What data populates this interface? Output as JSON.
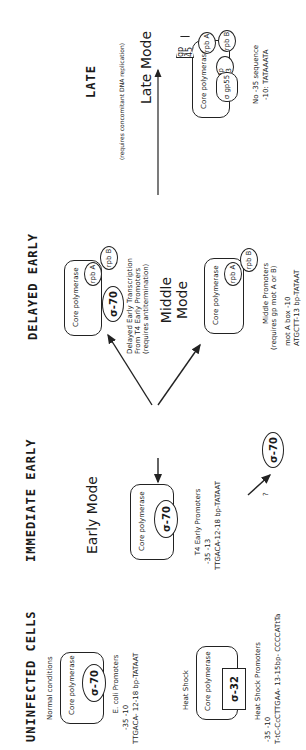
{
  "sections": {
    "uninfected": {
      "title": "UNINFECTED CELLS",
      "normal_label": "Normal conditions",
      "core_label": "Core polymerase",
      "sigma_label": "σ-70",
      "promoter_title": "E. coli Promoters",
      "promoter_positions": "-35          -10",
      "promoter_seq": "TTGACA- 12-18 bp-TATAAT",
      "heat_label": "Heat Shock",
      "heat_core_label": "Core polymerase",
      "heat_sigma_label": "σ-32",
      "heat_promoter_title": "Heat Shock Promoters",
      "heat_promoter_positions": "-35                    -10",
      "heat_promoter_seq": "T-tC-CcCTTGAA- 13-15bp- CCCCATtTa"
    },
    "immediate_early": {
      "title": "IMMEDIATE EARLY",
      "mode": "Early Mode",
      "core_label": "Core polymerase",
      "sigma_label": "σ-70",
      "promoter_title": "T4 Early Promoters",
      "promoter_positions": "-35          -13",
      "promoter_seq": "TTGACA-12-18 bp-TATAAT"
    },
    "delayed_early": {
      "title": "DELAYED EARLY",
      "core_label": "Core polymerase",
      "rpoA_label": "rpb A",
      "rpoB_label": "rpb B",
      "sigma_label": "σ-70",
      "desc_line1": "Delayed Early Transcription",
      "desc_line2": "From T4 Early Promoters",
      "desc_line3": "(requires antitermination)"
    },
    "middle": {
      "mode_line1": "Middle",
      "mode_line2": "Mode",
      "core_label": "Core polymerase",
      "rpoA_label": "rpb A",
      "rpoB_label": "rpb B",
      "question": "?",
      "sigma_label": "σ-70",
      "promoter_title": "Middle Promoters",
      "promoter_req": "(requires gp mot A or B)",
      "motA_label": "mot A box         -10",
      "motA_seq": "ATGCTT-13 bp-TATAAT"
    },
    "late": {
      "title": "LATE",
      "requirement": "(requires concomitant DNA replication)",
      "mode": "Late Mode",
      "core_label": "Core polymerase",
      "gp45_label": "gp 45",
      "rpoA_label": "rpb A",
      "rpoB_label": "rpb B",
      "gp33_label": "gp 33",
      "sigma_label": "σ gp55",
      "promoter_line1": "No -35 sequence",
      "promoter_line2": "-10: TATAAATA"
    }
  }
}
